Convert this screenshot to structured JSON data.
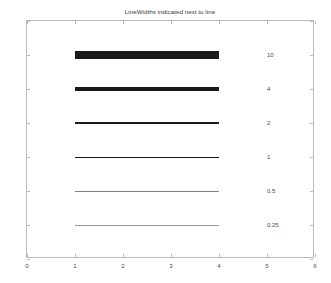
{
  "chart_data": {
    "type": "line",
    "title": "LineWidths indicated next to line",
    "xlabel": "",
    "ylabel": "",
    "xlim": [
      0,
      6
    ],
    "ylim": [
      0,
      7
    ],
    "xticks": [
      "0",
      "1",
      "2",
      "3",
      "4",
      "5",
      "6"
    ],
    "yticks": [
      "0",
      "1",
      "2",
      "3",
      "4",
      "5",
      "6",
      "7"
    ],
    "grid": false,
    "legend": "none",
    "line_color": "#1a1a1a",
    "x_span": [
      1,
      4
    ],
    "series": [
      {
        "name": "linewidth-10",
        "y": 6,
        "x": [
          1,
          4
        ],
        "linewidth": 10,
        "label": "10"
      },
      {
        "name": "linewidth-4",
        "y": 5,
        "x": [
          1,
          4
        ],
        "linewidth": 4,
        "label": "4"
      },
      {
        "name": "linewidth-2",
        "y": 4,
        "x": [
          1,
          4
        ],
        "linewidth": 2,
        "label": "2"
      },
      {
        "name": "linewidth-1",
        "y": 3,
        "x": [
          1,
          4
        ],
        "linewidth": 1,
        "label": "1"
      },
      {
        "name": "linewidth-0.5",
        "y": 2,
        "x": [
          1,
          4
        ],
        "linewidth": 0.5,
        "label": "0.5"
      },
      {
        "name": "linewidth-0.25",
        "y": 1,
        "x": [
          1,
          4
        ],
        "linewidth": 0.25,
        "label": "0.25"
      }
    ],
    "annotations": [
      {
        "text": "10",
        "x": 5,
        "y": 6
      },
      {
        "text": "4",
        "x": 5,
        "y": 5
      },
      {
        "text": "2",
        "x": 5,
        "y": 4
      },
      {
        "text": "1",
        "x": 5,
        "y": 3
      },
      {
        "text": "0.5",
        "x": 5,
        "y": 2
      },
      {
        "text": "0.25",
        "x": 5,
        "y": 1
      }
    ]
  }
}
